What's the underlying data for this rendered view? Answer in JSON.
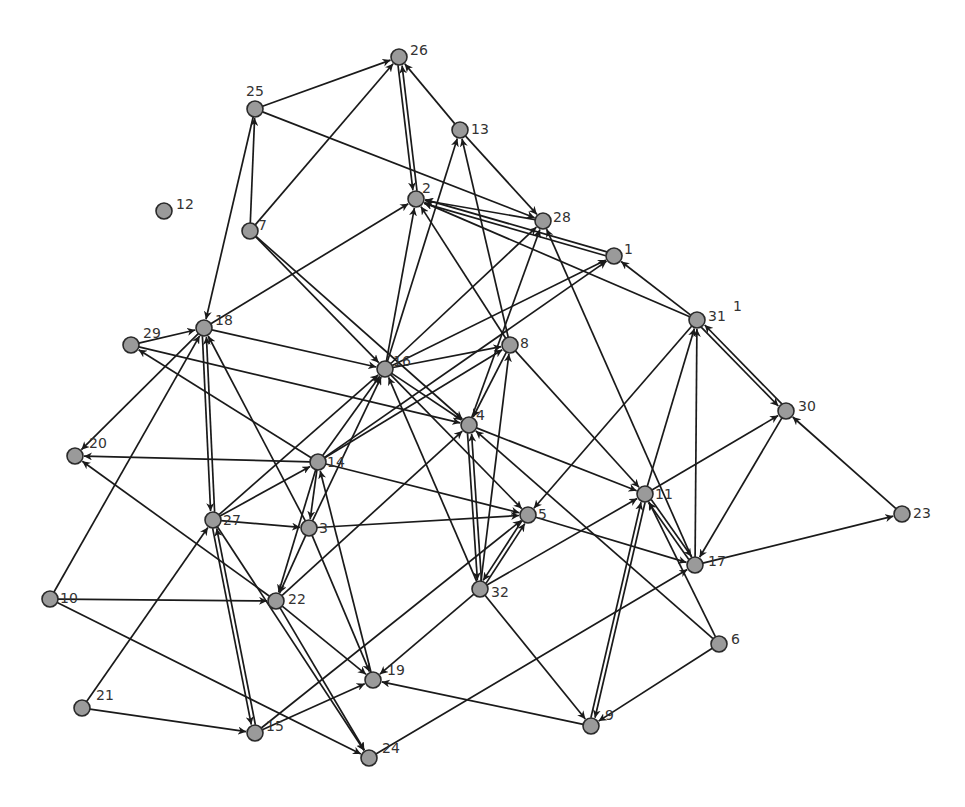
{
  "graph": {
    "type": "directed-network",
    "node_color": "#9a9a9a",
    "node_stroke": "#2a2a2a",
    "edge_color": "#1a1a1a",
    "node_radius": 8,
    "nodes": [
      {
        "id": "1",
        "x": 614,
        "y": 256,
        "lx": 10,
        "ly": -2
      },
      {
        "id": "2",
        "x": 416,
        "y": 199,
        "lx": 6,
        "ly": -6
      },
      {
        "id": "3",
        "x": 309,
        "y": 528,
        "lx": 10,
        "ly": 5
      },
      {
        "id": "4",
        "x": 469,
        "y": 425,
        "lx": 7,
        "ly": -5
      },
      {
        "id": "5",
        "x": 528,
        "y": 515,
        "lx": 10,
        "ly": 4
      },
      {
        "id": "6",
        "x": 719,
        "y": 644,
        "lx": 12,
        "ly": 0
      },
      {
        "id": "7",
        "x": 250,
        "y": 231,
        "lx": 8,
        "ly": -1
      },
      {
        "id": "8",
        "x": 510,
        "y": 345,
        "lx": 10,
        "ly": 3
      },
      {
        "id": "9",
        "x": 591,
        "y": 726,
        "lx": 14,
        "ly": -6
      },
      {
        "id": "10",
        "x": 50,
        "y": 599,
        "lx": 10,
        "ly": 4
      },
      {
        "id": "11",
        "x": 645,
        "y": 494,
        "lx": 10,
        "ly": 5
      },
      {
        "id": "12",
        "x": 164,
        "y": 211,
        "lx": 12,
        "ly": -2
      },
      {
        "id": "13",
        "x": 460,
        "y": 130,
        "lx": 11,
        "ly": 4
      },
      {
        "id": "14",
        "x": 318,
        "y": 462,
        "lx": 9,
        "ly": 5
      },
      {
        "id": "15",
        "x": 255,
        "y": 733,
        "lx": 11,
        "ly": -2
      },
      {
        "id": "16",
        "x": 385,
        "y": 369,
        "lx": 8,
        "ly": -3
      },
      {
        "id": "17",
        "x": 695,
        "y": 565,
        "lx": 13,
        "ly": 1
      },
      {
        "id": "18",
        "x": 204,
        "y": 328,
        "lx": 11,
        "ly": -3
      },
      {
        "id": "19",
        "x": 373,
        "y": 680,
        "lx": 14,
        "ly": -5
      },
      {
        "id": "20",
        "x": 75,
        "y": 456,
        "lx": 14,
        "ly": -8
      },
      {
        "id": "21",
        "x": 82,
        "y": 708,
        "lx": 14,
        "ly": -8
      },
      {
        "id": "22",
        "x": 276,
        "y": 601,
        "lx": 12,
        "ly": 3
      },
      {
        "id": "23",
        "x": 902,
        "y": 514,
        "lx": 11,
        "ly": 4
      },
      {
        "id": "24",
        "x": 369,
        "y": 758,
        "lx": 13,
        "ly": -5
      },
      {
        "id": "25",
        "x": 255,
        "y": 109,
        "lx": -9,
        "ly": -13
      },
      {
        "id": "26",
        "x": 399,
        "y": 57,
        "lx": 11,
        "ly": -2
      },
      {
        "id": "27",
        "x": 213,
        "y": 520,
        "lx": 10,
        "ly": 5
      },
      {
        "id": "28",
        "x": 543,
        "y": 221,
        "lx": 10,
        "ly": 1
      },
      {
        "id": "29",
        "x": 131,
        "y": 345,
        "lx": 12,
        "ly": -7
      },
      {
        "id": "30",
        "x": 786,
        "y": 411,
        "lx": 12,
        "ly": 0
      },
      {
        "id": "31",
        "x": 697,
        "y": 320,
        "lx": 11,
        "ly": 1
      },
      {
        "id": "32",
        "x": 480,
        "y": 589,
        "lx": 11,
        "ly": 8
      }
    ],
    "edges": [
      {
        "from": "25",
        "to": "26"
      },
      {
        "from": "7",
        "to": "26"
      },
      {
        "from": "13",
        "to": "26"
      },
      {
        "from": "26",
        "to": "2"
      },
      {
        "from": "2",
        "to": "26"
      },
      {
        "from": "25",
        "to": "28"
      },
      {
        "from": "13",
        "to": "28"
      },
      {
        "from": "7",
        "to": "25"
      },
      {
        "from": "25",
        "to": "18"
      },
      {
        "from": "1",
        "to": "2"
      },
      {
        "from": "28",
        "to": "2"
      },
      {
        "from": "1",
        "to": "2"
      },
      {
        "from": "31",
        "to": "2"
      },
      {
        "from": "31",
        "to": "1"
      },
      {
        "from": "18",
        "to": "2"
      },
      {
        "from": "16",
        "to": "2"
      },
      {
        "from": "16",
        "to": "13"
      },
      {
        "from": "16",
        "to": "28"
      },
      {
        "from": "16",
        "to": "1"
      },
      {
        "from": "14",
        "to": "1"
      },
      {
        "from": "8",
        "to": "13"
      },
      {
        "from": "8",
        "to": "2"
      },
      {
        "from": "4",
        "to": "28"
      },
      {
        "from": "17",
        "to": "28"
      },
      {
        "from": "7",
        "to": "16"
      },
      {
        "from": "7",
        "to": "4"
      },
      {
        "from": "18",
        "to": "16"
      },
      {
        "from": "29",
        "to": "18"
      },
      {
        "from": "29",
        "to": "4"
      },
      {
        "from": "14",
        "to": "29"
      },
      {
        "from": "18",
        "to": "20"
      },
      {
        "from": "10",
        "to": "18"
      },
      {
        "from": "27",
        "to": "18"
      },
      {
        "from": "18",
        "to": "27"
      },
      {
        "from": "3",
        "to": "18"
      },
      {
        "from": "16",
        "to": "8"
      },
      {
        "from": "16",
        "to": "4"
      },
      {
        "from": "16",
        "to": "5"
      },
      {
        "from": "27",
        "to": "16"
      },
      {
        "from": "14",
        "to": "16"
      },
      {
        "from": "14",
        "to": "8"
      },
      {
        "from": "3",
        "to": "16"
      },
      {
        "from": "32",
        "to": "16"
      },
      {
        "from": "22",
        "to": "4"
      },
      {
        "from": "8",
        "to": "11"
      },
      {
        "from": "4",
        "to": "11"
      },
      {
        "from": "4",
        "to": "32"
      },
      {
        "from": "32",
        "to": "4"
      },
      {
        "from": "6",
        "to": "4"
      },
      {
        "from": "32",
        "to": "8"
      },
      {
        "from": "8",
        "to": "4"
      },
      {
        "from": "14",
        "to": "20"
      },
      {
        "from": "14",
        "to": "3"
      },
      {
        "from": "14",
        "to": "22"
      },
      {
        "from": "14",
        "to": "5"
      },
      {
        "from": "19",
        "to": "14"
      },
      {
        "from": "27",
        "to": "14"
      },
      {
        "from": "27",
        "to": "3"
      },
      {
        "from": "3",
        "to": "5"
      },
      {
        "from": "3",
        "to": "22"
      },
      {
        "from": "3",
        "to": "19"
      },
      {
        "from": "27",
        "to": "15"
      },
      {
        "from": "15",
        "to": "27"
      },
      {
        "from": "21",
        "to": "27"
      },
      {
        "from": "27",
        "to": "24"
      },
      {
        "from": "22",
        "to": "20"
      },
      {
        "from": "10",
        "to": "22"
      },
      {
        "from": "10",
        "to": "24"
      },
      {
        "from": "22",
        "to": "24"
      },
      {
        "from": "22",
        "to": "19"
      },
      {
        "from": "21",
        "to": "15"
      },
      {
        "from": "15",
        "to": "19"
      },
      {
        "from": "15",
        "to": "5"
      },
      {
        "from": "9",
        "to": "19"
      },
      {
        "from": "32",
        "to": "19"
      },
      {
        "from": "5",
        "to": "32"
      },
      {
        "from": "32",
        "to": "5"
      },
      {
        "from": "32",
        "to": "11"
      },
      {
        "from": "32",
        "to": "9"
      },
      {
        "from": "31",
        "to": "5"
      },
      {
        "from": "5",
        "to": "17"
      },
      {
        "from": "11",
        "to": "31"
      },
      {
        "from": "11",
        "to": "30"
      },
      {
        "from": "11",
        "to": "9"
      },
      {
        "from": "9",
        "to": "11"
      },
      {
        "from": "11",
        "to": "17"
      },
      {
        "from": "17",
        "to": "11"
      },
      {
        "from": "6",
        "to": "11"
      },
      {
        "from": "31",
        "to": "30"
      },
      {
        "from": "30",
        "to": "31"
      },
      {
        "from": "17",
        "to": "31"
      },
      {
        "from": "30",
        "to": "17"
      },
      {
        "from": "23",
        "to": "30"
      },
      {
        "from": "17",
        "to": "23"
      },
      {
        "from": "24",
        "to": "17"
      },
      {
        "from": "6",
        "to": "9"
      }
    ],
    "stray_label": {
      "text": "1",
      "x": 733,
      "y": 311
    }
  }
}
